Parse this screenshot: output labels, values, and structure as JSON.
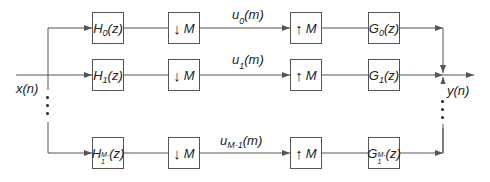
{
  "diagram": {
    "type": "M-channel filter bank",
    "input_label": "x(n)",
    "output_label": "y(n)",
    "channels": [
      {
        "analysis": {
          "name": "H",
          "sub": "0",
          "arg": "(z)"
        },
        "down": {
          "glyph": "↓",
          "label": "M"
        },
        "signal": {
          "name": "u",
          "sub": "0",
          "arg": "(m)"
        },
        "up": {
          "glyph": "↑",
          "label": "M"
        },
        "synthesis": {
          "name": "G",
          "sub": "0",
          "arg": "(z)"
        }
      },
      {
        "analysis": {
          "name": "H",
          "sub": "1",
          "arg": "(z)"
        },
        "down": {
          "glyph": "↓",
          "label": "M"
        },
        "signal": {
          "name": "u",
          "sub": "1",
          "arg": "(m)"
        },
        "up": {
          "glyph": "↑",
          "label": "M"
        },
        "synthesis": {
          "name": "G",
          "sub": "1",
          "arg": "(z)"
        }
      },
      {
        "analysis": {
          "name": "H",
          "sub": "M-1",
          "arg": "(z)"
        },
        "down": {
          "glyph": "↓",
          "label": "M"
        },
        "signal": {
          "name": "u",
          "sub": "M-1",
          "arg": "(m)"
        },
        "up": {
          "glyph": "↑",
          "label": "M"
        },
        "synthesis": {
          "name": "G",
          "sub": "M-1",
          "arg": "(z)"
        }
      }
    ],
    "colors": {
      "line": "#555555",
      "text": "#222222",
      "background": "#ffffff"
    }
  }
}
